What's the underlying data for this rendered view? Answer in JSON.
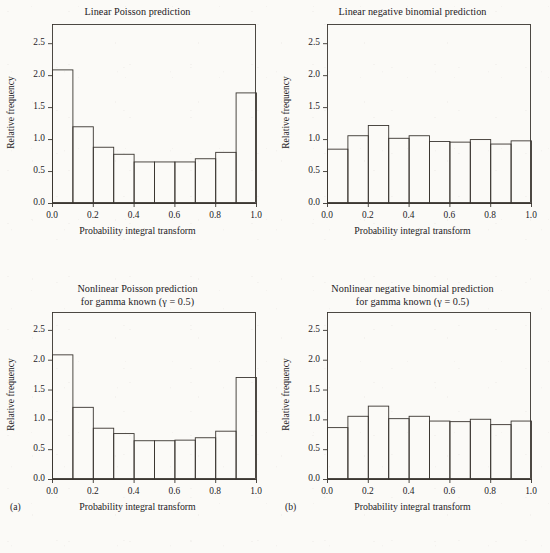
{
  "figure": {
    "panel_letters": [
      "(a)",
      "(b)"
    ],
    "axis": {
      "xlabel": "Probability integral transform",
      "ylabel": "Relative frequency",
      "xticks": [
        "0.0",
        "0.2",
        "0.4",
        "0.6",
        "0.8",
        "1.0"
      ],
      "xtick_values": [
        0.0,
        0.2,
        0.4,
        0.6,
        0.8,
        1.0
      ],
      "yticks": [
        "0.0",
        "0.5",
        "1.0",
        "1.5",
        "2.0",
        "2.5"
      ],
      "ytick_values": [
        0.0,
        0.5,
        1.0,
        1.5,
        2.0,
        2.5
      ],
      "xlim": [
        0.0,
        1.0
      ],
      "ylim": [
        0.0,
        2.8
      ],
      "grid": false,
      "line_color": "#3a3530",
      "bar_fill": "none"
    }
  },
  "chart_data": [
    {
      "type": "bar",
      "id": "linear-poisson",
      "position": "top-left",
      "title": "Linear Poisson prediction",
      "xlabel": "Probability integral transform",
      "ylabel": "Relative frequency",
      "xlim": [
        0.0,
        1.0
      ],
      "ylim": [
        0.0,
        2.8
      ],
      "grid": false,
      "bin_edges": [
        0.0,
        0.1,
        0.2,
        0.3,
        0.4,
        0.5,
        0.6,
        0.7,
        0.8,
        0.9,
        1.0
      ],
      "categories": [
        "0.0-0.1",
        "0.1-0.2",
        "0.2-0.3",
        "0.3-0.4",
        "0.4-0.5",
        "0.5-0.6",
        "0.6-0.7",
        "0.7-0.8",
        "0.8-0.9",
        "0.9-1.0"
      ],
      "values": [
        2.09,
        1.2,
        0.88,
        0.77,
        0.65,
        0.65,
        0.65,
        0.7,
        0.8,
        1.73
      ]
    },
    {
      "type": "bar",
      "id": "linear-negative-binomial",
      "position": "top-right",
      "title": "Linear negative binomial prediction",
      "xlabel": "Probability integral transform",
      "ylabel": "Relative frequency",
      "xlim": [
        0.0,
        1.0
      ],
      "ylim": [
        0.0,
        2.8
      ],
      "grid": false,
      "bin_edges": [
        0.0,
        0.1,
        0.2,
        0.3,
        0.4,
        0.5,
        0.6,
        0.7,
        0.8,
        0.9,
        1.0
      ],
      "categories": [
        "0.0-0.1",
        "0.1-0.2",
        "0.2-0.3",
        "0.3-0.4",
        "0.4-0.5",
        "0.5-0.6",
        "0.6-0.7",
        "0.7-0.8",
        "0.8-0.9",
        "0.9-1.0"
      ],
      "values": [
        0.85,
        1.06,
        1.22,
        1.02,
        1.06,
        0.97,
        0.96,
        1.0,
        0.93,
        0.98
      ]
    },
    {
      "type": "bar",
      "id": "nonlinear-poisson",
      "position": "bottom-left",
      "title": "Nonlinear Poisson prediction\nfor gamma known (γ = 0.5)",
      "title_line1": "Nonlinear Poisson prediction",
      "title_line2": "for gamma known (γ = 0.5)",
      "xlabel": "Probability integral transform",
      "ylabel": "Relative frequency",
      "xlim": [
        0.0,
        1.0
      ],
      "ylim": [
        0.0,
        2.8
      ],
      "grid": false,
      "bin_edges": [
        0.0,
        0.1,
        0.2,
        0.3,
        0.4,
        0.5,
        0.6,
        0.7,
        0.8,
        0.9,
        1.0
      ],
      "categories": [
        "0.0-0.1",
        "0.1-0.2",
        "0.2-0.3",
        "0.3-0.4",
        "0.4-0.5",
        "0.5-0.6",
        "0.6-0.7",
        "0.7-0.8",
        "0.8-0.9",
        "0.9-1.0"
      ],
      "values": [
        2.09,
        1.21,
        0.86,
        0.77,
        0.65,
        0.65,
        0.66,
        0.7,
        0.81,
        1.71
      ]
    },
    {
      "type": "bar",
      "id": "nonlinear-negative-binomial",
      "position": "bottom-right",
      "title": "Nonlinear negative binomial prediction\nfor gamma known (γ = 0.5)",
      "title_line1": "Nonlinear negative binomial prediction",
      "title_line2": "for gamma known (γ = 0.5)",
      "xlabel": "Probability integral transform",
      "ylabel": "Relative frequency",
      "xlim": [
        0.0,
        1.0
      ],
      "ylim": [
        0.0,
        2.8
      ],
      "grid": false,
      "bin_edges": [
        0.0,
        0.1,
        0.2,
        0.3,
        0.4,
        0.5,
        0.6,
        0.7,
        0.8,
        0.9,
        1.0
      ],
      "categories": [
        "0.0-0.1",
        "0.1-0.2",
        "0.2-0.3",
        "0.3-0.4",
        "0.4-0.5",
        "0.5-0.6",
        "0.6-0.7",
        "0.7-0.8",
        "0.8-0.9",
        "0.9-1.0"
      ],
      "values": [
        0.87,
        1.06,
        1.23,
        1.02,
        1.06,
        0.98,
        0.97,
        1.01,
        0.92,
        0.98
      ]
    }
  ]
}
